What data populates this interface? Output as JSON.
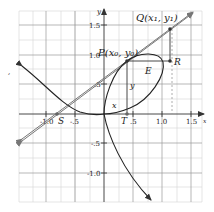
{
  "figure": {
    "axes": {
      "x_label": "x",
      "y_label": "y",
      "x_ticks": [
        {
          "v": -1.0,
          "label": "-1.0"
        },
        {
          "v": -0.5,
          "label": "-.5"
        },
        {
          "v": 0.5,
          "label": ".5"
        },
        {
          "v": 1.0,
          "label": "1.0"
        },
        {
          "v": 1.5,
          "label": "1.5"
        }
      ],
      "y_ticks": [
        {
          "v": 1.5,
          "label": "1.5"
        },
        {
          "v": 1.0,
          "label": "1.0"
        },
        {
          "v": 0.5,
          "label": ".5"
        },
        {
          "v": -0.5,
          "label": "-.5"
        },
        {
          "v": -1.0,
          "label": "-1.0"
        }
      ]
    },
    "points": {
      "Q": "Q(x₁, y₁)",
      "P": "P(x₀, y₀)",
      "R": "R",
      "E": "E",
      "S": "S",
      "T": "T"
    },
    "segment_labels": {
      "x": "x",
      "y": "y"
    },
    "side_mark": ","
  }
}
